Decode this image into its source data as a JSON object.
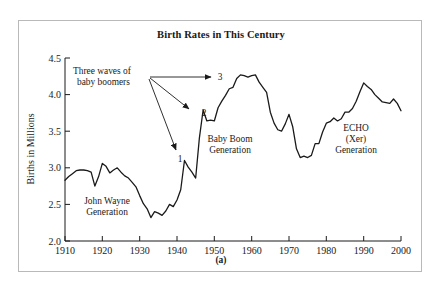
{
  "figure": {
    "title": "Birth Rates in This Century",
    "caption": "(a)",
    "border_color": "#b9b9b9",
    "line_color": "#1a1a1a"
  },
  "chart_data": {
    "type": "line",
    "title": "Birth Rates in This Century",
    "xlabel": "",
    "ylabel": "Births in Millions",
    "xlim": [
      1910,
      2000
    ],
    "ylim": [
      2.0,
      4.5
    ],
    "grid": false,
    "legend": "none",
    "xticks": [
      1910,
      1920,
      1930,
      1940,
      1950,
      1960,
      1970,
      1980,
      1990,
      2000
    ],
    "xtick_labels": [
      "1910",
      "1920",
      "1930",
      "1940",
      "1950",
      "1960",
      "1970",
      "1980",
      "1990",
      "2000"
    ],
    "yticks": [
      2.0,
      2.5,
      3.0,
      3.5,
      4.0,
      4.5
    ],
    "ytick_labels": [
      "2.0",
      "2.5",
      "3.0",
      "3.5",
      "4.0",
      "4.5"
    ],
    "series": [
      {
        "name": "Births in Millions",
        "x": [
          1910,
          1911,
          1912,
          1913,
          1914,
          1915,
          1916,
          1917,
          1918,
          1919,
          1920,
          1921,
          1922,
          1923,
          1924,
          1925,
          1926,
          1927,
          1928,
          1929,
          1930,
          1931,
          1932,
          1933,
          1934,
          1935,
          1936,
          1937,
          1938,
          1939,
          1940,
          1941,
          1942,
          1943,
          1944,
          1945,
          1946,
          1947,
          1948,
          1949,
          1950,
          1951,
          1952,
          1953,
          1954,
          1955,
          1956,
          1957,
          1958,
          1959,
          1960,
          1961,
          1962,
          1963,
          1964,
          1965,
          1966,
          1967,
          1968,
          1969,
          1970,
          1971,
          1972,
          1973,
          1974,
          1975,
          1976,
          1977,
          1978,
          1979,
          1980,
          1981,
          1982,
          1983,
          1984,
          1985,
          1986,
          1987,
          1988,
          1989,
          1990,
          1991,
          1992,
          1993,
          1994,
          1995,
          1996,
          1997,
          1998,
          1999,
          2000
        ],
        "values": [
          2.83,
          2.88,
          2.92,
          2.96,
          2.97,
          2.97,
          2.96,
          2.94,
          2.75,
          2.88,
          3.06,
          3.02,
          2.93,
          2.97,
          3.0,
          2.94,
          2.89,
          2.86,
          2.8,
          2.74,
          2.62,
          2.51,
          2.44,
          2.32,
          2.4,
          2.38,
          2.35,
          2.41,
          2.5,
          2.47,
          2.56,
          2.7,
          3.1,
          3.01,
          2.94,
          2.86,
          3.41,
          3.79,
          3.64,
          3.65,
          3.64,
          3.82,
          3.91,
          3.99,
          4.08,
          4.1,
          4.22,
          4.27,
          4.26,
          4.24,
          4.26,
          4.27,
          4.17,
          4.1,
          4.03,
          3.76,
          3.61,
          3.52,
          3.5,
          3.6,
          3.73,
          3.56,
          3.26,
          3.14,
          3.16,
          3.14,
          3.17,
          3.33,
          3.33,
          3.49,
          3.61,
          3.63,
          3.68,
          3.64,
          3.67,
          3.76,
          3.76,
          3.81,
          3.91,
          4.04,
          4.16,
          4.11,
          4.07,
          4.0,
          3.95,
          3.9,
          3.89,
          3.88,
          3.94,
          3.88,
          3.78
        ]
      }
    ],
    "annotations": [
      {
        "id": "three-waves",
        "text": "Three waves of baby boomers",
        "lines": [
          "Three waves of",
          "baby boomers"
        ],
        "x": 1927,
        "y": 4.42
      },
      {
        "id": "wave-1",
        "text": "1",
        "x": 1942,
        "y": 3.34
      },
      {
        "id": "wave-2",
        "text": "2",
        "x": 1948,
        "y": 3.92
      },
      {
        "id": "wave-3",
        "text": "3",
        "x": 1958,
        "y": 4.4
      },
      {
        "id": "john-wayne",
        "text": "John Wayne Generation",
        "lines": [
          "John Wayne",
          "Generation"
        ],
        "x": 1921,
        "y": 2.55
      },
      {
        "id": "baby-boom",
        "text": "Baby Boom Generation",
        "lines": [
          "Baby Boom",
          "Generation"
        ],
        "x": 1957,
        "y": 3.45
      },
      {
        "id": "echo",
        "text": "ECHO (Xer) Generation",
        "lines": [
          "ECHO",
          "(Xer)",
          "Generation"
        ],
        "x": 1990,
        "y": 3.52
      }
    ]
  }
}
